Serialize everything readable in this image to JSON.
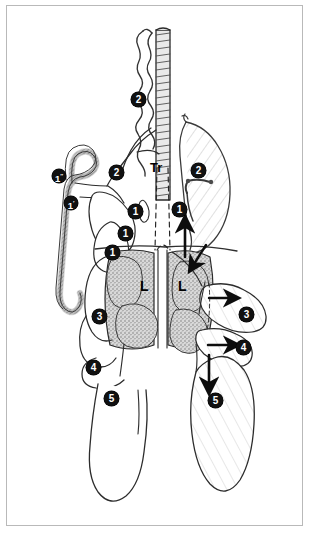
{
  "figure": {
    "background": "#ffffff",
    "border_color": "#b9b9b9",
    "ink_color": "#1a1a1a",
    "shade_color": "#9a9a9a"
  },
  "labels": {
    "trachea": "Tr",
    "lung_left": "L",
    "lung_right": "L",
    "cervical_air_sac_1": "1",
    "cervical_air_sac_1_prime": "1′",
    "cervical_air_sac_1_dprime": "1″",
    "clavicular_air_sac_2": "2",
    "cranial_thoracic_air_sac_3": "3",
    "caudal_thoracic_air_sac_4": "4",
    "abdominal_air_sac_5": "5"
  },
  "markers": [
    {
      "id": "m-2-top",
      "text": "2",
      "x": 138,
      "y": 98,
      "sup": ""
    },
    {
      "id": "m-1-dprime",
      "text": "1",
      "x": 57,
      "y": 176,
      "sup": "″"
    },
    {
      "id": "m-1-prime",
      "text": "1",
      "x": 68,
      "y": 203,
      "sup": "′"
    },
    {
      "id": "m-2-left",
      "text": "2",
      "x": 114,
      "y": 171,
      "sup": ""
    },
    {
      "id": "m-2-right",
      "text": "2",
      "x": 197,
      "y": 169,
      "sup": ""
    },
    {
      "id": "m-1-leftmid",
      "text": "1",
      "x": 126,
      "y": 211,
      "sup": ""
    },
    {
      "id": "m-1-rightmid",
      "text": "1",
      "x": 178,
      "y": 208,
      "sup": ""
    },
    {
      "id": "m-1-upper",
      "text": "1",
      "x": 124,
      "y": 233,
      "sup": ""
    },
    {
      "id": "m-1-lower",
      "text": "1",
      "x": 111,
      "y": 252,
      "sup": ""
    },
    {
      "id": "m-3-left",
      "text": "3",
      "x": 98,
      "y": 316,
      "sup": ""
    },
    {
      "id": "m-3-right",
      "text": "3",
      "x": 245,
      "y": 314,
      "sup": ""
    },
    {
      "id": "m-4-left",
      "text": "4",
      "x": 92,
      "y": 367,
      "sup": ""
    },
    {
      "id": "m-4-right",
      "text": "4",
      "x": 242,
      "y": 347,
      "sup": ""
    },
    {
      "id": "m-5-left",
      "text": "5",
      "x": 110,
      "y": 398,
      "sup": ""
    },
    {
      "id": "m-5-right",
      "text": "5",
      "x": 214,
      "y": 400,
      "sup": ""
    }
  ],
  "text_labels": [
    {
      "id": "t-tr",
      "text": "Tr",
      "x": 152,
      "y": 168
    },
    {
      "id": "t-l-left",
      "text": "L",
      "x": 142,
      "y": 280
    },
    {
      "id": "t-l-right",
      "text": "L",
      "x": 180,
      "y": 280
    }
  ],
  "arrows": [
    {
      "id": "arrow-up-center",
      "direction": "up"
    },
    {
      "id": "arrow-diagonal-right",
      "direction": "down-left"
    },
    {
      "id": "arrow-right-upper",
      "direction": "right"
    },
    {
      "id": "arrow-right-lower",
      "direction": "right"
    },
    {
      "id": "arrow-down-caudal",
      "direction": "down"
    }
  ]
}
